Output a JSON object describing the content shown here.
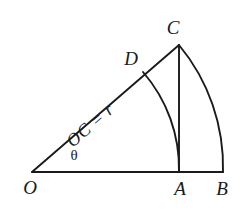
{
  "figure": {
    "background_color": "#ffffff",
    "stroke_color": "#1a1a1a",
    "text_color": "#1a1a1a",
    "width": 250,
    "height": 214
  },
  "labels": {
    "origin": "O",
    "foot": "A",
    "arc_end": "B",
    "apex": "C",
    "inner_arc_start": "D",
    "angle": "θ",
    "radius_expression": "OC = r"
  },
  "geometry": {
    "points": {
      "O": {
        "x": 32,
        "y": 172
      },
      "A": {
        "x": 179,
        "y": 172
      },
      "B": {
        "x": 223,
        "y": 172
      },
      "C": {
        "x": 179,
        "y": 45
      },
      "D": {
        "x": 143,
        "y": 72
      }
    },
    "label_positions": {
      "O": {
        "x": 30,
        "y": 187
      },
      "A": {
        "x": 180,
        "y": 188
      },
      "B": {
        "x": 222,
        "y": 188
      },
      "C": {
        "x": 173,
        "y": 27
      },
      "D": {
        "x": 131,
        "y": 58
      },
      "angle": {
        "x": 74,
        "y": 155
      },
      "radius_expression": {
        "x": 90,
        "y": 125,
        "rotation": -40.8
      }
    },
    "segments": [
      {
        "name": "baseline-OB",
        "from": "O",
        "to": "B"
      },
      {
        "name": "hypotenuse-OC",
        "from": "O",
        "to": "C"
      },
      {
        "name": "vertical-CA",
        "from": "C",
        "to": "A"
      }
    ],
    "arcs": [
      {
        "name": "inner-arc-DA",
        "center": "O",
        "radius": 147,
        "from": "D",
        "to": "A"
      },
      {
        "name": "outer-arc-CB",
        "center": "O",
        "radius": 191,
        "from": "C",
        "to": "B"
      }
    ],
    "angle_degrees": 40.8
  }
}
